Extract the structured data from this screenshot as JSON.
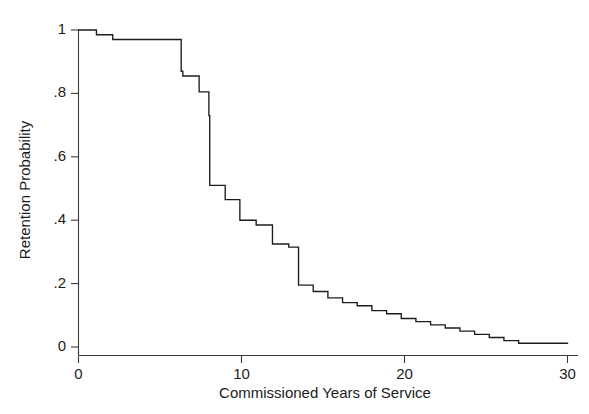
{
  "chart_data": {
    "type": "line",
    "subtype": "step-function",
    "title": "",
    "xlabel": "Commissioned Years of Service",
    "ylabel": "Retention Probability",
    "xlim": [
      0,
      30
    ],
    "ylim": [
      0,
      1
    ],
    "xticks": [
      0,
      10,
      20,
      30
    ],
    "xtick_labels": [
      "0",
      "10",
      "20",
      "30"
    ],
    "yticks": [
      0,
      0.2,
      0.4,
      0.6,
      0.8,
      1
    ],
    "ytick_labels": [
      "0",
      ".2",
      ".4",
      ".6",
      ".8",
      "1"
    ],
    "grid": false,
    "legend": null,
    "legend_position": "none",
    "series": [
      {
        "name": "Retention Probability",
        "color": "#1c1c1c",
        "step": "post",
        "x": [
          0,
          1.1,
          2.1,
          6.3,
          6.4,
          7.4,
          8.0,
          8.05,
          9.0,
          9.9,
          10.9,
          11.9,
          12.9,
          13.5,
          14.4,
          15.3,
          16.2,
          17.1,
          18.0,
          18.9,
          19.8,
          20.7,
          21.6,
          22.5,
          23.4,
          24.3,
          25.2,
          26.1,
          27.0,
          30.0
        ],
        "y": [
          1.0,
          0.985,
          0.97,
          0.87,
          0.855,
          0.805,
          0.73,
          0.51,
          0.465,
          0.4,
          0.385,
          0.325,
          0.315,
          0.195,
          0.175,
          0.155,
          0.14,
          0.13,
          0.115,
          0.105,
          0.09,
          0.08,
          0.07,
          0.06,
          0.05,
          0.04,
          0.03,
          0.02,
          0.012,
          0.01
        ]
      }
    ]
  },
  "axes": {
    "y_label": "Retention Probability",
    "x_label": "Commissioned Years of Service"
  }
}
